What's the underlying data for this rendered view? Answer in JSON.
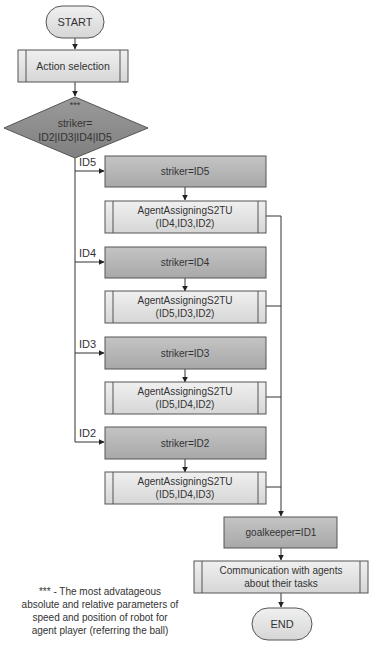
{
  "flowchart": {
    "start": "START",
    "action_selection": "Action selection",
    "decision": {
      "marker": "***",
      "line1": "striker=",
      "line2": "ID2|ID3|ID4|ID5"
    },
    "branches": [
      {
        "edge_label": "ID5",
        "assign": "striker=ID5",
        "subprocess_line1": "AgentAssigningS2TU",
        "subprocess_line2": "(ID4,ID3,ID2)"
      },
      {
        "edge_label": "ID4",
        "assign": "striker=ID4",
        "subprocess_line1": "AgentAssigningS2TU",
        "subprocess_line2": "(ID5,ID3,ID2)"
      },
      {
        "edge_label": "ID3",
        "assign": "striker=ID3",
        "subprocess_line1": "AgentAssigningS2TU",
        "subprocess_line2": "(ID5,ID4,ID2)"
      },
      {
        "edge_label": "ID2",
        "assign": "striker=ID2",
        "subprocess_line1": "AgentAssigningS2TU",
        "subprocess_line2": "(ID5,ID4,ID3)"
      }
    ],
    "goalkeeper": "goalkeeper=ID1",
    "communication_line1": "Communication with agents",
    "communication_line2": "about their tasks",
    "end": "END"
  },
  "footnote": {
    "line1": "*** - The most advatageous",
    "line2": "absolute and relative parameters of",
    "line3": "speed and position of robot for",
    "line4": "agent player (referring the ball)"
  },
  "colors": {
    "dark_fill": "#a9a9a9",
    "light_fill": "#e4e4e4",
    "process_fill": "#bdbdbd",
    "stroke": "#555555"
  }
}
